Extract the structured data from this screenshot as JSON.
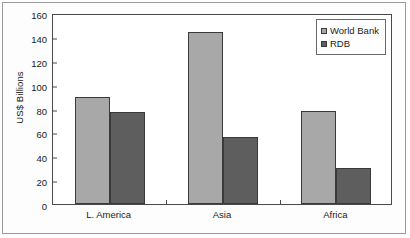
{
  "chart_data": {
    "type": "bar",
    "title": "",
    "xlabel": "",
    "ylabel": "US$ Billions",
    "categories": [
      "L. America",
      "Asia",
      "Africa"
    ],
    "series": [
      {
        "name": "World Bank",
        "color": "#a8a8a8",
        "values": [
          90,
          144,
          78
        ]
      },
      {
        "name": "RDB",
        "color": "#5e5e5e",
        "values": [
          77,
          56,
          30
        ]
      }
    ],
    "ylim": [
      0,
      160
    ],
    "yticks": [
      0,
      20,
      40,
      60,
      80,
      100,
      120,
      140,
      160
    ],
    "ytick_labels": [
      "0",
      "20",
      "40",
      "60",
      "80",
      "100",
      "120",
      "140",
      "160"
    ],
    "grid": false,
    "legend_position": "top-right",
    "legend_entries": [
      "World Bank",
      "RDB"
    ],
    "frame": true
  }
}
